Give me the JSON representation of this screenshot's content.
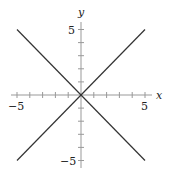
{
  "chart_data": {
    "type": "line",
    "title": "",
    "xlabel": "x",
    "ylabel": "y",
    "xlim": [
      -5.5,
      5.5
    ],
    "ylim": [
      -5.5,
      5.5
    ],
    "grid": false,
    "x_ticks": [
      -5,
      -4,
      -3,
      -2,
      -1,
      0,
      1,
      2,
      3,
      4,
      5
    ],
    "y_ticks": [
      -5,
      -4,
      -3,
      -2,
      -1,
      0,
      1,
      2,
      3,
      4,
      5
    ],
    "x_tick_labels": [
      "−5",
      "5"
    ],
    "y_tick_labels": [
      "5",
      "−5"
    ],
    "series": [
      {
        "name": "y = x",
        "x": [
          -5,
          5
        ],
        "y": [
          -5,
          5
        ],
        "color": "#333333"
      },
      {
        "name": "y = -x",
        "x": [
          -5,
          5
        ],
        "y": [
          5,
          -5
        ],
        "color": "#333333"
      }
    ]
  },
  "labels": {
    "x_axis": "x",
    "y_axis": "y",
    "x_min": "−5",
    "x_max": "5",
    "y_max": "5",
    "y_min": "−5"
  }
}
